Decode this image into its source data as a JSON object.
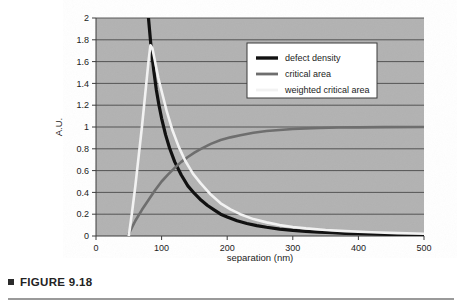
{
  "figure": {
    "caption": "FIGURE 9.18",
    "marker_icon": "square-bullet-icon"
  },
  "chart_data": {
    "type": "line",
    "title": "",
    "xlabel": "separation (nm)",
    "ylabel": "A.U.",
    "xlim": [
      0,
      500
    ],
    "ylim": [
      0,
      2
    ],
    "grid": "horizontal",
    "legend_position": "top-right-inside",
    "xticks": [
      "0",
      "100",
      "200",
      "300",
      "400",
      "500"
    ],
    "xtick_values": [
      0,
      100,
      200,
      300,
      400,
      500
    ],
    "yticks": [
      "0",
      "0.2",
      "0.4",
      "0.6",
      "0.8",
      "1",
      "1.2",
      "1.4",
      "1.6",
      "1.8",
      "2"
    ],
    "ytick_values": [
      0,
      0.2,
      0.4,
      0.6,
      0.8,
      1.0,
      1.2,
      1.4,
      1.6,
      1.8,
      2.0
    ],
    "plot_background": "#b2b2b2",
    "gridline_color": "#4a4a4a",
    "series": [
      {
        "name": "defect density",
        "color": "#111111",
        "width": 3.2,
        "x": [
          80,
          84,
          88,
          92,
          96,
          100,
          106,
          112,
          120,
          130,
          140,
          150,
          160,
          170,
          180,
          190,
          200,
          215,
          230,
          245,
          260,
          280,
          300,
          320,
          340,
          360,
          380,
          400,
          430,
          460,
          500
        ],
        "y": [
          2.0,
          1.73,
          1.52,
          1.34,
          1.2,
          1.08,
          0.93,
          0.81,
          0.68,
          0.56,
          0.46,
          0.39,
          0.33,
          0.28,
          0.24,
          0.2,
          0.175,
          0.14,
          0.115,
          0.095,
          0.08,
          0.063,
          0.051,
          0.042,
          0.035,
          0.03,
          0.025,
          0.022,
          0.017,
          0.013,
          0.009
        ]
      },
      {
        "name": "critical area",
        "color": "#6e6e6e",
        "width": 2.6,
        "x": [
          50,
          55,
          60,
          70,
          80,
          90,
          100,
          110,
          120,
          130,
          140,
          150,
          160,
          175,
          190,
          205,
          220,
          240,
          260,
          280,
          300,
          320,
          340,
          370,
          400,
          440,
          500
        ],
        "y": [
          0.02,
          0.08,
          0.14,
          0.24,
          0.33,
          0.42,
          0.5,
          0.565,
          0.625,
          0.68,
          0.725,
          0.765,
          0.8,
          0.845,
          0.88,
          0.905,
          0.925,
          0.948,
          0.963,
          0.973,
          0.981,
          0.987,
          0.991,
          0.995,
          0.997,
          0.999,
          1.0
        ]
      },
      {
        "name": "weighted critical area",
        "color": "#f2f2f2",
        "width": 2.6,
        "x": [
          50,
          55,
          60,
          65,
          70,
          75,
          80,
          83,
          86,
          90,
          95,
          100,
          108,
          116,
          126,
          136,
          148,
          160,
          175,
          190,
          205,
          220,
          240,
          260,
          280,
          300,
          320,
          350,
          380,
          420,
          460,
          500
        ],
        "y": [
          0.0,
          0.22,
          0.46,
          0.73,
          1.0,
          1.3,
          1.6,
          1.75,
          1.72,
          1.6,
          1.45,
          1.33,
          1.14,
          0.98,
          0.82,
          0.69,
          0.57,
          0.48,
          0.38,
          0.3,
          0.245,
          0.2,
          0.155,
          0.125,
          0.1,
          0.083,
          0.07,
          0.055,
          0.045,
          0.034,
          0.026,
          0.02
        ]
      }
    ],
    "legend_entries": [
      {
        "label": "defect density",
        "color": "#111111",
        "width": 3.4
      },
      {
        "label": "critical area",
        "color": "#6e6e6e",
        "width": 2.8
      },
      {
        "label": "weighted critical area",
        "color": "#f2f2f2",
        "width": 2.8
      }
    ]
  }
}
